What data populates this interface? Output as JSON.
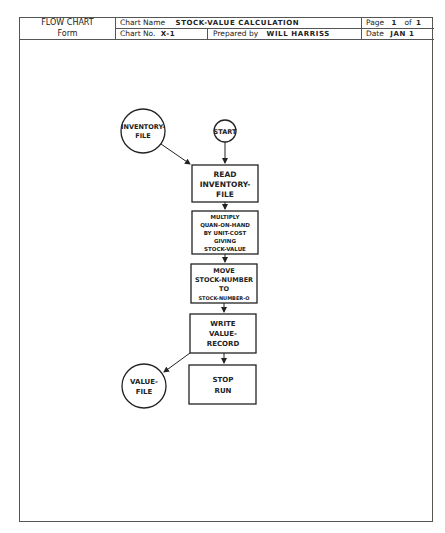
{
  "header": {
    "form_title_line1": "FLOW CHART",
    "form_title_line2": "Form",
    "chart_name_label": "Chart Name",
    "chart_name_value": "STOCK-VALUE CALCULATION",
    "chart_no_label": "Chart No.",
    "chart_no_value": "X-1",
    "prepared_by_label": "Prepared by",
    "prepared_by_value": "WILL HARRISS",
    "page_label": "Page",
    "page_value": "1",
    "page_of_label": "of",
    "page_total": "1",
    "date_label": "Date",
    "date_value": "JAN 1"
  },
  "flowchart": {
    "nodes": [
      {
        "id": "inventory-file",
        "shape": "circle",
        "lines": [
          "INVENTORY-",
          "FILE"
        ]
      },
      {
        "id": "start",
        "shape": "circle",
        "lines": [
          "START"
        ]
      },
      {
        "id": "read",
        "shape": "box",
        "lines": [
          "READ",
          "INVENTORY-",
          "FILE"
        ]
      },
      {
        "id": "multiply",
        "shape": "box",
        "lines": [
          "MULTIPLY",
          "QUAN-ON-HAND",
          "BY UNIT-COST",
          "GIVING",
          "STOCK-VALUE"
        ]
      },
      {
        "id": "move",
        "shape": "box",
        "lines": [
          "MOVE",
          "STOCK-NUMBER",
          "TO",
          "STOCK-NUMBER-O"
        ]
      },
      {
        "id": "write",
        "shape": "box",
        "lines": [
          "WRITE",
          "VALUE-",
          "RECORD"
        ]
      },
      {
        "id": "value-file",
        "shape": "circle",
        "lines": [
          "VALUE-",
          "FILE"
        ]
      },
      {
        "id": "stop",
        "shape": "box",
        "lines": [
          "STOP",
          "RUN"
        ]
      }
    ],
    "edges": [
      [
        "inventory-file",
        "read"
      ],
      [
        "start",
        "read"
      ],
      [
        "read",
        "multiply"
      ],
      [
        "multiply",
        "move"
      ],
      [
        "move",
        "write"
      ],
      [
        "write",
        "value-file"
      ],
      [
        "write",
        "stop"
      ]
    ]
  }
}
